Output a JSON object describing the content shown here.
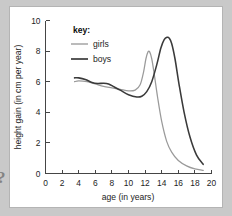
{
  "figure": {
    "background_color": "#c9c9c9",
    "panel_color": "#ffffff",
    "panel_border_color": "#b4b4b4",
    "edge_glyph": "?"
  },
  "legend": {
    "title": "key:",
    "entries": [
      {
        "label": "girls",
        "color": "#9a9a9a"
      },
      {
        "label": "boys",
        "color": "#3a3a3a"
      }
    ]
  },
  "chart_data": {
    "type": "line",
    "title": "",
    "xlabel": "age (in years)",
    "ylabel": "height gain (in cm per year)",
    "xlim": [
      0,
      20
    ],
    "ylim": [
      0,
      10
    ],
    "xticks": [
      0,
      2,
      4,
      6,
      8,
      10,
      12,
      14,
      16,
      18,
      20
    ],
    "yticks": [
      0,
      2,
      4,
      6,
      8,
      10
    ],
    "grid": false,
    "legend_position": "top-center",
    "annotations": [],
    "series": [
      {
        "name": "girls",
        "color": "#9a9a9a",
        "x": [
          3.5,
          4.0,
          5.0,
          6.0,
          7.0,
          8.0,
          9.0,
          10.0,
          10.8,
          11.4,
          11.8,
          12.1,
          12.35,
          12.55,
          12.8,
          13.1,
          13.5,
          14.0,
          14.6,
          15.2,
          16.0,
          17.0,
          18.0,
          19.0
        ],
        "y": [
          6.0,
          6.05,
          6.0,
          5.85,
          5.7,
          5.6,
          5.5,
          5.4,
          5.45,
          5.8,
          6.6,
          7.5,
          7.95,
          7.95,
          7.5,
          6.5,
          5.0,
          3.4,
          2.1,
          1.4,
          0.85,
          0.5,
          0.3,
          0.2
        ]
      },
      {
        "name": "boys",
        "color": "#3a3a3a",
        "x": [
          3.5,
          4.0,
          4.8,
          5.6,
          6.3,
          7.0,
          7.6,
          8.3,
          9.0,
          10.0,
          11.0,
          11.6,
          12.2,
          12.8,
          13.4,
          13.9,
          14.3,
          14.65,
          14.9,
          15.2,
          15.6,
          16.1,
          16.7,
          17.4,
          18.2,
          19.0
        ],
        "y": [
          6.25,
          6.25,
          6.15,
          5.95,
          5.88,
          5.9,
          5.85,
          5.65,
          5.45,
          5.15,
          5.0,
          5.05,
          5.35,
          6.0,
          7.1,
          8.2,
          8.75,
          8.9,
          8.85,
          8.5,
          7.5,
          5.8,
          4.0,
          2.4,
          1.2,
          0.6
        ]
      }
    ]
  }
}
